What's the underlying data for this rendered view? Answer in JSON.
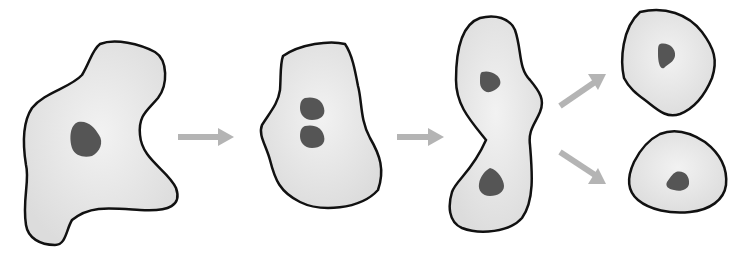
{
  "diagram": {
    "colors": {
      "background": "#ffffff",
      "cell_fill": "#e8e8e8",
      "cell_stroke": "#111111",
      "nucleus": "#555555",
      "arrow": "#b4b4b4"
    },
    "stages": [
      {
        "name": "parent-cell",
        "nuclei": 1
      },
      {
        "name": "nucleus-dividing",
        "nuclei": 2
      },
      {
        "name": "cytokinesis",
        "nuclei": 2
      },
      {
        "name": "daughter-cells",
        "cells": 2,
        "nuclei_per_cell": 1
      }
    ],
    "arrows": [
      "stage1-to-stage2",
      "stage2-to-stage3",
      "stage3-to-daughter-top",
      "stage3-to-daughter-bottom"
    ]
  }
}
